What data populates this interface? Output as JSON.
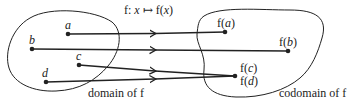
{
  "title": {
    "prefix": "f: ",
    "var": "x",
    "maps_to": "↦",
    "fn": "f(",
    "var2": "x",
    "close": ")"
  },
  "domain": {
    "label": "domain of f",
    "points": [
      {
        "name": "a",
        "x": 68,
        "y": 34
      },
      {
        "name": "b",
        "x": 32,
        "y": 49
      },
      {
        "name": "c",
        "x": 79,
        "y": 65
      },
      {
        "name": "d",
        "x": 46,
        "y": 82
      }
    ]
  },
  "codomain": {
    "label": "codomain of f",
    "images": [
      {
        "label_pre": "f(",
        "arg": "a",
        "label_post": ")",
        "x": 225,
        "y": 32
      },
      {
        "label_pre": "f(",
        "arg": "b",
        "label_post": ")",
        "x": 288,
        "y": 51
      },
      {
        "label_pre": "f(",
        "arg": "c",
        "label_post": ")",
        "x": 235,
        "y": 76
      },
      {
        "label_pre": "f(",
        "arg": "d",
        "label_post": ")",
        "x": 235,
        "y": 76
      }
    ]
  },
  "colors": {
    "stroke": "#222222",
    "background": "#ffffff"
  }
}
